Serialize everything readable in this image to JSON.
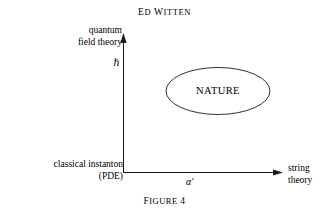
{
  "page": {
    "background_color": "#ffffff",
    "ink_color": "#1a1a1a",
    "width": 329,
    "height": 213
  },
  "running_head": {
    "text": "ED WITTEN",
    "first_letters": "EW",
    "lead": "E",
    "rest": "D ",
    "second_lead": "W",
    "second_rest": "ITTEN"
  },
  "diagram": {
    "y_axis": {
      "label_line1": "quantum",
      "label_line2": "field theory",
      "unit_symbol": "ℏ",
      "arrow": "up"
    },
    "x_axis": {
      "label": "α′",
      "end_label_line1": "string",
      "end_label_line2": "theory",
      "arrow": "right"
    },
    "origin": {
      "label_line1": "classical instanton",
      "label_line2": "(PDE)"
    },
    "region": {
      "shape": "ellipse",
      "label": "NATURE"
    }
  },
  "caption": {
    "word_lead": "F",
    "word_rest": "IGURE",
    "number": "4"
  }
}
